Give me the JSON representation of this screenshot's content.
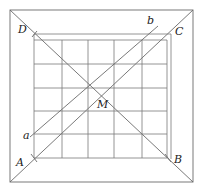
{
  "diagram": {
    "type": "geometry",
    "colors": {
      "line": "#6a6a6a",
      "grid": "#7a7a7a",
      "label": "#222222",
      "background": "#ffffff"
    },
    "outer_square": {
      "x1": 10,
      "y1": 10,
      "x2": 193,
      "y2": 182
    },
    "inner_square": {
      "x1": 34,
      "y1": 34,
      "x2": 171,
      "y2": 159
    },
    "grid": {
      "columns": 5,
      "rows": 5,
      "x_lines": [
        34,
        62,
        88,
        114,
        142,
        167
      ],
      "y_lines": [
        40,
        64,
        88,
        111,
        134,
        158
      ]
    },
    "points": {
      "A": {
        "label": "A",
        "x": 34,
        "y": 158,
        "label_x": 16,
        "label_y": 166
      },
      "B": {
        "label": "B",
        "x": 168,
        "y": 158,
        "label_x": 174,
        "label_y": 163
      },
      "C": {
        "label": "C",
        "x": 171,
        "y": 34,
        "label_x": 175,
        "label_y": 35
      },
      "D": {
        "label": "D",
        "x": 34,
        "y": 34,
        "label_x": 18,
        "label_y": 33
      },
      "M": {
        "label": "M",
        "x": 102,
        "y": 98,
        "label_x": 97,
        "label_y": 108
      }
    },
    "lines": {
      "a": {
        "label": "a",
        "x1": 30,
        "y1": 137,
        "x2": 158,
        "y2": 26,
        "label_x": 23,
        "label_y": 139
      },
      "b": {
        "label": "b",
        "label_x": 147,
        "label_y": 24
      }
    }
  }
}
